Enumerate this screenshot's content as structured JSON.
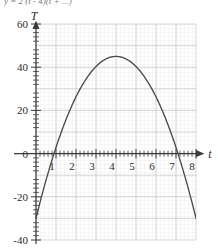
{
  "top_caption": "y = 2 (t - 4)(t + ...)",
  "chart_data": {
    "type": "line",
    "title": "",
    "xlabel": "t",
    "ylabel": "T",
    "xlim": [
      0,
      8.25
    ],
    "ylim": [
      -40,
      60
    ],
    "grid": true,
    "grid_major_step_x": 1,
    "grid_major_step_y": 10,
    "grid_minor_step_x": 0.2,
    "grid_minor_step_y": 2,
    "legend": "none",
    "x_ticks": [
      1,
      2,
      3,
      4,
      5,
      6,
      7,
      8
    ],
    "x_tick_labels": [
      "1",
      "2",
      "3",
      "4",
      "5",
      "6",
      "7",
      "8"
    ],
    "y_ticks": [
      -40,
      -20,
      0,
      20,
      40,
      60
    ],
    "y_tick_labels": [
      "-40",
      "-20",
      "0",
      "20",
      "40",
      "60"
    ],
    "curve": {
      "name": "T(t)",
      "shape": "parabola",
      "vertex": [
        4,
        45
      ],
      "roots": [
        0.9,
        7.1
      ],
      "color": "#4a4a4a",
      "x": [
        0.33,
        0.5,
        0.75,
        1.0,
        1.25,
        1.5,
        1.75,
        2.0,
        2.25,
        2.5,
        2.75,
        3.0,
        3.25,
        3.5,
        3.75,
        4.0,
        4.25,
        4.5,
        4.75,
        5.0,
        5.25,
        5.5,
        5.75,
        6.0,
        6.25,
        6.5,
        6.75,
        7.0,
        7.25,
        7.5,
        7.75,
        8.0
      ],
      "y": [
        -34.0,
        -24.3,
        -11.5,
        0.0,
        10.3,
        19.4,
        27.2,
        33.9,
        39.3,
        43.5,
        44.9,
        44.9,
        44.9,
        44.9,
        44.9,
        45.0,
        44.9,
        44.9,
        44.9,
        43.5,
        39.3,
        33.9,
        27.2,
        19.4,
        10.3,
        0.0,
        -11.5,
        -24.3,
        -34.0,
        -34.0,
        -34.0,
        -34.0
      ]
    }
  },
  "icons": {
    "x_axis_arrow": "arrow-right-icon",
    "y_axis_arrow": "arrow-up-icon"
  }
}
